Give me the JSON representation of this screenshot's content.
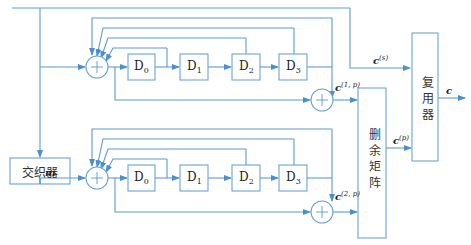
{
  "diagram": {
    "title": "",
    "colors": {
      "line": "#5b9bd5",
      "box": "#6aa3d8",
      "text": "#222222"
    },
    "blocks": {
      "interleaver": "交织器",
      "puncturing_matrix": "删余矩阵",
      "multiplexer": "复用器"
    },
    "encoder1": {
      "delays": [
        "D",
        "D",
        "D",
        "D"
      ],
      "delay_subs": [
        "0",
        "1",
        "2",
        "3"
      ],
      "output_label": "c",
      "output_sup": "(1, p)"
    },
    "encoder2": {
      "delays": [
        "D",
        "D",
        "D",
        "D"
      ],
      "delay_subs": [
        "0",
        "1",
        "2",
        "3"
      ],
      "output_label": "c",
      "output_sup": "(2, p)"
    },
    "signals": {
      "systematic": {
        "base": "c",
        "sup": "(s)"
      },
      "parity": {
        "base": "c",
        "sup": "(p)"
      },
      "interleaved_input": {
        "base": "m",
        "sup": "′"
      },
      "output": "c"
    }
  }
}
